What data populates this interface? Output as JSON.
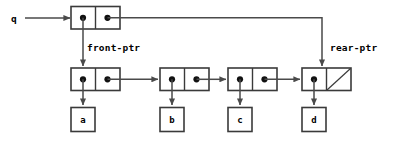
{
  "diagram": {
    "canvas": {
      "width": 395,
      "height": 143,
      "background": "#ffffff"
    },
    "colors": {
      "stroke": "#3a3a3a",
      "link": "#4a4a4a",
      "dot": "#111111",
      "text": "#000000",
      "background": "#ffffff"
    },
    "variable": {
      "name": "q",
      "label": "q"
    },
    "pointers": [
      {
        "id": "front",
        "label": "front-ptr"
      },
      {
        "id": "rear",
        "label": "rear-ptr"
      }
    ],
    "queue_record": {
      "name": "queue-pair",
      "cells": [
        {
          "id": "car",
          "content": "pointer",
          "target": "node-1"
        },
        {
          "id": "cdr",
          "content": "pointer",
          "target": "node-4"
        }
      ]
    },
    "nodes": [
      {
        "id": "node-1",
        "car": "pointer",
        "cdr": "pointer",
        "next": "node-2",
        "data": "a",
        "null_cdr": false
      },
      {
        "id": "node-2",
        "car": "pointer",
        "cdr": "pointer",
        "next": "node-3",
        "data": "b",
        "null_cdr": false
      },
      {
        "id": "node-3",
        "car": "pointer",
        "cdr": "pointer",
        "next": "node-4",
        "data": "c",
        "null_cdr": false
      },
      {
        "id": "node-4",
        "car": "pointer",
        "cdr": "null",
        "next": null,
        "data": "d",
        "null_cdr": true
      }
    ],
    "data_boxes": [
      {
        "id": "data-a",
        "label": "a"
      },
      {
        "id": "data-b",
        "label": "b"
      },
      {
        "id": "data-c",
        "label": "c"
      },
      {
        "id": "data-d",
        "label": "d"
      }
    ]
  }
}
